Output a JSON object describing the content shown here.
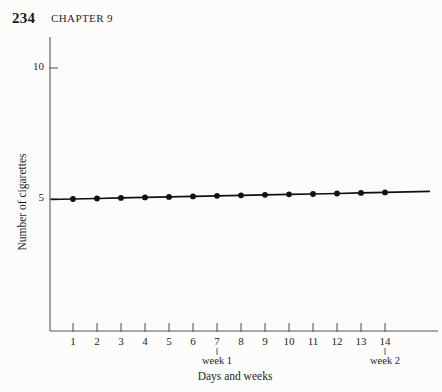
{
  "header": {
    "page_number": "234",
    "chapter": "CHAPTER 9"
  },
  "chart_data": {
    "type": "line",
    "title": "",
    "subtitle": "",
    "xlabel": "Days and weeks",
    "ylabel": "Number of cigarettes",
    "x": [
      1,
      2,
      3,
      4,
      5,
      6,
      7,
      8,
      9,
      10,
      11,
      12,
      13,
      14
    ],
    "xtick_labels": [
      "1",
      "2",
      "3",
      "4",
      "5",
      "6",
      "7",
      "8",
      "9",
      "10",
      "11",
      "12",
      "13",
      "14"
    ],
    "ytick_labels": [
      "5",
      "10"
    ],
    "ytick_values": [
      5,
      10
    ],
    "xlim": [
      0,
      15
    ],
    "ylim": [
      0,
      11
    ],
    "grid": false,
    "legend": null,
    "marker": "filled-circle",
    "annotations": [
      {
        "label": "week 1",
        "x": 7
      },
      {
        "label": "week 2",
        "x": 14
      }
    ],
    "series": [
      {
        "name": "Number of cigarettes",
        "color": "#111111",
        "values": [
          5.0,
          5.02,
          5.04,
          5.06,
          5.08,
          5.1,
          5.12,
          5.14,
          5.16,
          5.18,
          5.19,
          5.21,
          5.23,
          5.25
        ]
      }
    ]
  },
  "colors": {
    "line": "#111111",
    "marker": "#111111",
    "axis": "#5a5a5a",
    "text": "#1f1f1f",
    "background": "#fcfcfa"
  }
}
